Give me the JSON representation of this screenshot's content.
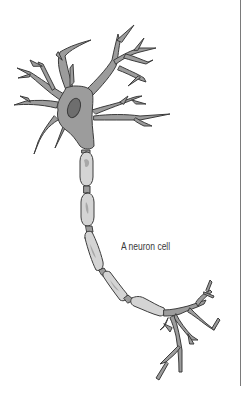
{
  "figure": {
    "caption": "A neuron cell",
    "colors": {
      "cell_body": "#9c9c9c",
      "outline": "#3c3c3c",
      "nucleus": "#6e6e6e",
      "myelin": "#d4d4d4",
      "myelin_spot": "#a8a8a8",
      "background": "#ffffff",
      "rule": "#7a7a7a"
    },
    "parts": [
      "dendrites",
      "cell body",
      "nucleus",
      "axon",
      "myelin sheath",
      "nodes of Ranvier",
      "axon terminals"
    ]
  }
}
